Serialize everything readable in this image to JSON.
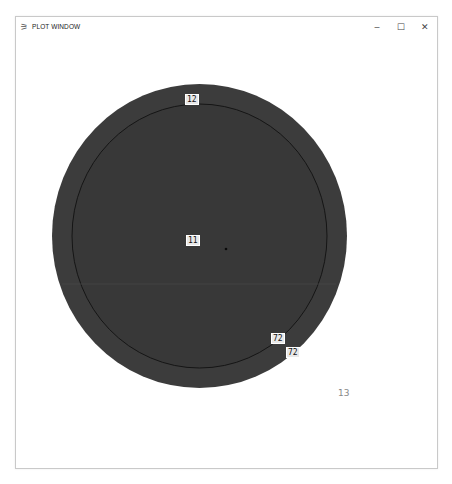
{
  "window": {
    "title": "PLOT WINDOW",
    "app_icon": "plot-app-icon",
    "controls": {
      "minimize": "–",
      "maximize": "☐",
      "close": "✕"
    }
  },
  "plot": {
    "colors": {
      "fill": "#3c3c3c",
      "inner_outline": "#1a1a1a",
      "label_bg": "#e8e8e8",
      "background": "#ffffff"
    },
    "outer_ellipse": {
      "cx": 199.5,
      "cy": 236,
      "rx": 147.5,
      "ry": 152
    },
    "inner_ellipse": {
      "cx": 199.5,
      "cy": 236,
      "rx": 127.5,
      "ry": 132
    },
    "center_marker": {
      "x": 226,
      "y": 249
    },
    "labels": [
      {
        "text": "12",
        "x": 185,
        "y": 94
      },
      {
        "text": "11",
        "x": 186,
        "y": 235
      },
      {
        "text": "72",
        "x": 271,
        "y": 333
      },
      {
        "text": "72",
        "x": 286,
        "y": 347
      }
    ],
    "outside_label": {
      "text": "13",
      "x": 338,
      "y": 388
    }
  }
}
